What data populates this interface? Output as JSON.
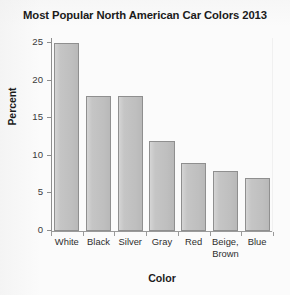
{
  "chart_data": {
    "type": "bar",
    "title": "Most Popular North American Car Colors 2013",
    "xlabel": "Color",
    "ylabel": "Percent",
    "categories": [
      "White",
      "Black",
      "Silver",
      "Gray",
      "Red",
      "Beige, Brown",
      "Blue"
    ],
    "values": [
      25,
      18,
      18,
      12,
      9,
      8,
      7
    ],
    "ylim": [
      0,
      25
    ],
    "yticks": [
      0,
      5,
      10,
      15,
      20,
      25
    ],
    "ytick_labels": [
      "0",
      "5",
      "10",
      "15",
      "20",
      "25"
    ],
    "grid": false,
    "legend": "none",
    "bar_color": "#c2c2c2",
    "bar_edge_color": "#8f8f8f",
    "axis_color": "#8e8e8e",
    "text_color": "#1b1b1b",
    "background_color": "#fbfbfb",
    "series": [
      {
        "name": "Percent",
        "values": [
          25,
          18,
          18,
          12,
          9,
          8,
          7
        ]
      }
    ],
    "points": [
      {
        "category": "White",
        "value": 25
      },
      {
        "category": "Black",
        "value": 18
      },
      {
        "category": "Silver",
        "value": 18
      },
      {
        "category": "Gray",
        "value": 12
      },
      {
        "category": "Red",
        "value": 9
      },
      {
        "category": "Beige, Brown",
        "value": 8
      },
      {
        "category": "Blue",
        "value": 7
      }
    ]
  }
}
